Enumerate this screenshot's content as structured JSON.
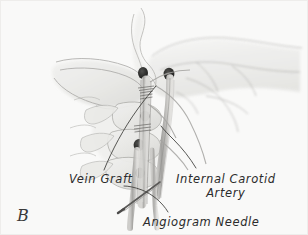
{
  "figure": {
    "letter": "B",
    "panel_background_color": "#fbfbfa",
    "ink_color": "#2b2b2b",
    "width_px": 308,
    "height_px": 235,
    "medium": "grayscale pencil / wash medical illustration",
    "view": "lateral head and neck, showing carotid artery reconstruction"
  },
  "labels": {
    "vein_graft": {
      "text": "Vein Graft",
      "x": 69,
      "y": 172
    },
    "internal_carotid_artery": {
      "line1": "Internal Carotid",
      "line2": "Artery",
      "x": 176,
      "y": 172
    },
    "angiogram_needle": {
      "text": "Angiogram Needle",
      "x": 143,
      "y": 215
    }
  },
  "leader_lines": {
    "vein_graft_leader": "curve from label up-right to graft at mid neck",
    "internal_carotid_leader": "curve from label up-left to artery near skull base",
    "angiogram_needle_leader": "curve from label up-left to needle shaft"
  },
  "anatomy": {
    "structures": [
      "skull base",
      "mandible",
      "nasal profile",
      "cervical vertebrae",
      "vertebral foramina",
      "internal carotid artery",
      "saphenous vein graft",
      "anastomosis suture lines",
      "angiogram needle"
    ],
    "vertebrae_count": 3
  }
}
